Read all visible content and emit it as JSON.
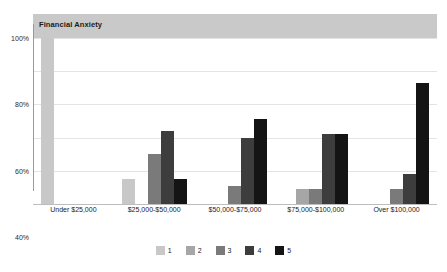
{
  "chart_data": {
    "type": "bar",
    "title": "Financial Anxiety",
    "xlabel": "",
    "ylabel": "",
    "ylim": [
      0,
      100
    ],
    "ytick_labels": [
      "0%",
      "20%",
      "40%",
      "60%",
      "80%",
      "100%"
    ],
    "ytick_values": [
      0,
      20,
      40,
      60,
      80,
      100
    ],
    "grid": true,
    "legend_position": "bottom",
    "categories": [
      "Under $25,000",
      "$25,000-$50,000",
      "$50,000-$75,000",
      "$75,000-$100,000",
      "Over $100,000"
    ],
    "series": [
      {
        "name": "1",
        "color": "#c8c8c8",
        "values": [
          100,
          15,
          null,
          null,
          null
        ]
      },
      {
        "name": "2",
        "color": "#a6a6a6",
        "values": [
          null,
          null,
          null,
          9,
          null
        ]
      },
      {
        "name": "3",
        "color": "#7a7a7a",
        "values": [
          null,
          30,
          11,
          9,
          9
        ]
      },
      {
        "name": "4",
        "color": "#3d3d3d",
        "values": [
          null,
          44,
          40,
          42,
          18
        ]
      },
      {
        "name": "5",
        "color": "#141414",
        "values": [
          null,
          15,
          51,
          42,
          73
        ]
      }
    ]
  },
  "legend": {
    "items": [
      {
        "label": "1",
        "color": "#c8c8c8"
      },
      {
        "label": "2",
        "color": "#a6a6a6"
      },
      {
        "label": "3",
        "color": "#7a7a7a"
      },
      {
        "label": "4",
        "color": "#3d3d3d"
      },
      {
        "label": "5",
        "color": "#141414"
      }
    ]
  },
  "colors": {
    "title_band": "#c9c9c9",
    "gridline": "#e4e4e4",
    "axis": "#9a9a9a",
    "text": "#1a1a1a",
    "background": "#ffffff"
  }
}
